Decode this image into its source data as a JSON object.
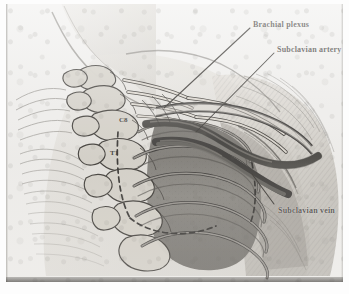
{
  "figure": {
    "kind": "anatomical-illustration",
    "medium": "graphite pencil drawing, scanned halftone plate",
    "view": "anterolateral right shoulder and root of neck"
  },
  "palette": {
    "paper": "#efeeec",
    "page": "#fdfdfd",
    "ink": "#2b2824",
    "line_dark": "#1a1816",
    "shade_mid": "#8d8a84",
    "shade_deep": "#4a4845",
    "bone_light": "#d8d4cc",
    "plate_edge": "#3c3a37"
  },
  "labels": [
    {
      "id": "brachial-plexus",
      "text": "Brachial plexus"
    },
    {
      "id": "subclavian-artery",
      "text": "Subclavian artery"
    },
    {
      "id": "subclavian-vein",
      "text": "Subclavian vein"
    }
  ],
  "bone_tags": [
    {
      "id": "c8",
      "text": "C8"
    },
    {
      "id": "t1",
      "text": "T1"
    }
  ],
  "structures": {
    "ribs_visible": 5,
    "vertebrae_outlined": 6,
    "dashed_marker": "pleural dome / lung apex outline",
    "leader_lines": 3
  }
}
